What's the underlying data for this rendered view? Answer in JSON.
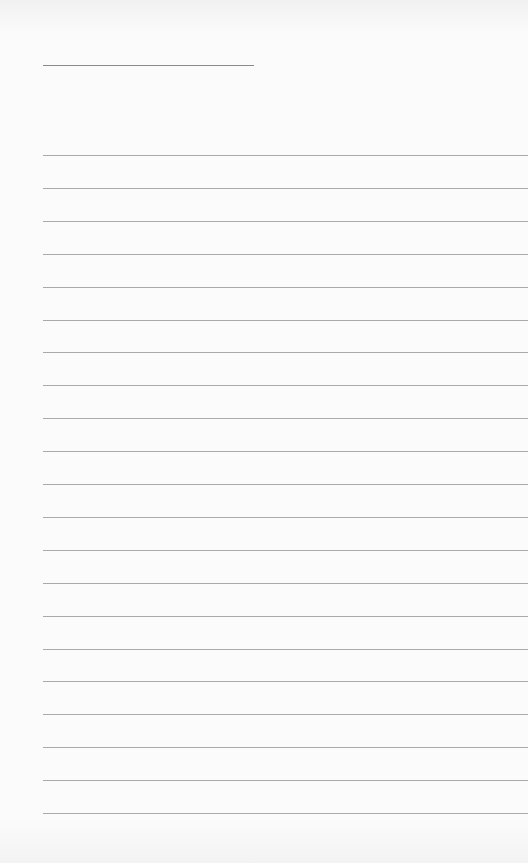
{
  "page": {
    "type": "lined-paper",
    "background_color": "#fbfbfb",
    "line_color": "#a9a9a9",
    "title_line": {
      "x": 43,
      "y": 65,
      "width": 211
    },
    "ruled_lines": {
      "count": 21,
      "start_y": 155,
      "spacing": 32.9,
      "left_x": 43
    }
  }
}
